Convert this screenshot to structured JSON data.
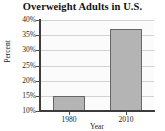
{
  "chart_data": {
    "type": "bar",
    "title": "Overweight Adults in U.S.",
    "xlabel": "Year",
    "ylabel": "Percent",
    "categories": [
      "1980",
      "2010"
    ],
    "values": [
      15,
      37
    ],
    "value_unit": "%",
    "ylim": [
      10,
      40
    ],
    "yticks": [
      10,
      15,
      20,
      25,
      30,
      35,
      40
    ],
    "ytick_labels": [
      "10%",
      "15%",
      "20%",
      "25%",
      "30%",
      "35%",
      "40%"
    ],
    "grid": true,
    "grid_axis": "y",
    "legend": false,
    "bar_color": "#b4b4b4",
    "bar_edge_color": "#666666",
    "plot_background": "#fbfbfb",
    "gridline_color": "#d2d2d2",
    "axis_color": "#3c3c3c",
    "text_color": "#222222"
  }
}
